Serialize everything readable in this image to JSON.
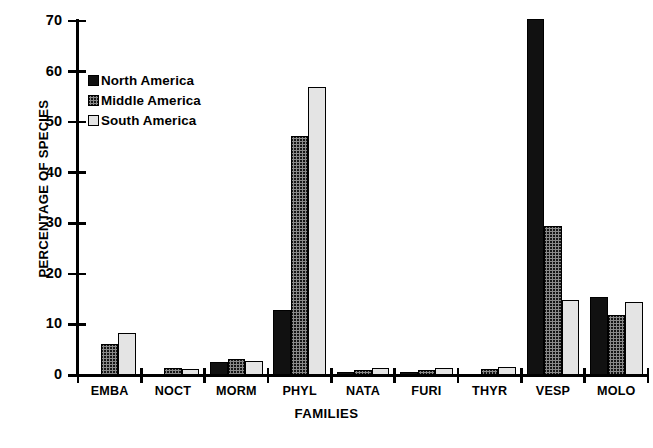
{
  "chart_data": {
    "type": "bar",
    "title": "",
    "xlabel": "FAMILIES",
    "ylabel": "PERCENTAGE OF SPECIES",
    "ylim": [
      0,
      70
    ],
    "yticks": [
      0,
      10,
      20,
      30,
      40,
      50,
      60,
      70
    ],
    "grid": false,
    "legend_position": "upper-left-inside",
    "categories": [
      "EMBA",
      "NOCT",
      "MORM",
      "PHYL",
      "NATA",
      "FURI",
      "THYR",
      "VESP",
      "MOLO"
    ],
    "series": [
      {
        "name": "North America",
        "color": "#111111",
        "fill": "solid-black",
        "values": [
          0,
          0,
          2.6,
          12.8,
          0.3,
          0.5,
          0,
          70.4,
          15.5
        ]
      },
      {
        "name": "Middle America",
        "color": "#8a8a8a",
        "fill": "hatched-gray",
        "values": [
          6.1,
          1.3,
          3.2,
          47.3,
          0.9,
          0.9,
          1.2,
          29.4,
          11.9
        ]
      },
      {
        "name": "South America",
        "color": "#e4e4e4",
        "fill": "light-gray",
        "values": [
          8.4,
          1.1,
          2.7,
          57.0,
          1.3,
          1.3,
          1.5,
          14.8,
          14.4
        ]
      }
    ]
  },
  "axes": {
    "y_title": "PERCENTAGE OF SPECIES",
    "x_title": "FAMILIES",
    "ytick_labels": [
      "70",
      "60",
      "50",
      "40",
      "30",
      "20",
      "10",
      "0"
    ]
  },
  "legend": {
    "entries": [
      {
        "label": "North America",
        "swatch": "solid-black-swatch"
      },
      {
        "label": "Middle America",
        "swatch": "hatched-gray-swatch"
      },
      {
        "label": "South America",
        "swatch": "light-gray-swatch"
      }
    ]
  },
  "caption": {
    "text": ""
  }
}
